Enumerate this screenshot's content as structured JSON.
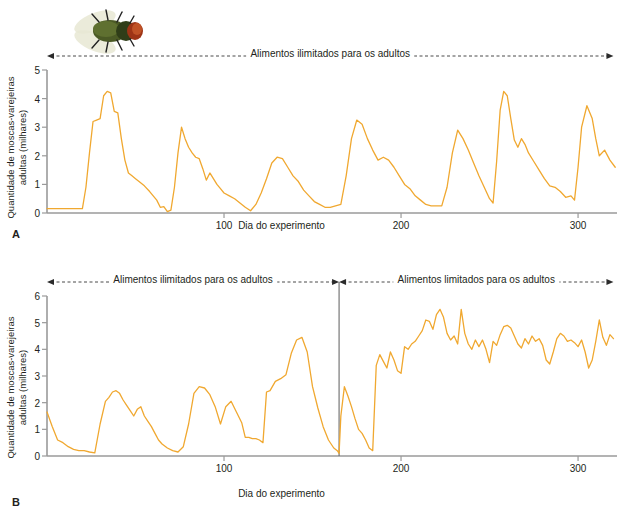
{
  "figure": {
    "organism_icon": "blowfly-photo",
    "line_color": "#F0A830",
    "axis_color": "#9a9a9a",
    "text_color": "#231f20"
  },
  "panels": [
    {
      "letter": "A",
      "ylabel_line1": "Quantidade de moscas-varejeiras",
      "ylabel_line2": "adultas (milhares)",
      "xlabel": "Dia do experimento",
      "yticks": [
        "0",
        "1",
        "2",
        "3",
        "4",
        "5"
      ],
      "xticks": [
        "100",
        "200",
        "300"
      ],
      "annotations": [
        {
          "text": "Alimentos ilimitados para os adultos",
          "from_day": 0,
          "to_day": 320
        }
      ]
    },
    {
      "letter": "B",
      "ylabel_line1": "Quantidade de moscas-varejeiras",
      "ylabel_line2": "adultas (milhares)",
      "xlabel": "Dia do experimento",
      "yticks": [
        "0",
        "1",
        "2",
        "3",
        "4",
        "5",
        "6"
      ],
      "xticks": [
        "100",
        "200",
        "300"
      ],
      "annotations": [
        {
          "text": "Alimentos ilimitados para os adultos",
          "from_day": 0,
          "to_day": 165
        },
        {
          "text": "Alimentos limitados para os adultos",
          "from_day": 165,
          "to_day": 320
        }
      ],
      "divider_day": 165
    }
  ],
  "chart_data": [
    {
      "type": "line",
      "title": "A",
      "xlabel": "Dia do experimento",
      "ylabel": "Quantidade de moscas-varejeiras adultas (milhares)",
      "xlim": [
        0,
        322
      ],
      "ylim": [
        0,
        5
      ],
      "xticks": [
        100,
        200,
        300
      ],
      "yticks": [
        0,
        1,
        2,
        3,
        4,
        5
      ],
      "grid": false,
      "legend": "none",
      "series": [
        {
          "name": "Quantidade de moscas adultas",
          "color": "#F0A830",
          "x": [
            0,
            6,
            12,
            16,
            20,
            22,
            24,
            26,
            28,
            30,
            32,
            34,
            36,
            38,
            40,
            42,
            44,
            46,
            48,
            50,
            52,
            55,
            58,
            60,
            62,
            64,
            66,
            68,
            70,
            72,
            74,
            76,
            78,
            80,
            82,
            84,
            86,
            88,
            90,
            92,
            94,
            96,
            98,
            100,
            103,
            106,
            109,
            112,
            115,
            118,
            121,
            124,
            127,
            130,
            133,
            136,
            139,
            142,
            145,
            148,
            151,
            154,
            157,
            160,
            163,
            166,
            169,
            172,
            175,
            178,
            181,
            184,
            187,
            190,
            193,
            196,
            199,
            202,
            205,
            208,
            211,
            214,
            217,
            220,
            223,
            226,
            229,
            232,
            235,
            238,
            241,
            244,
            247,
            250,
            252,
            254,
            256,
            258,
            260,
            262,
            264,
            266,
            268,
            270,
            272,
            275,
            278,
            281,
            284,
            287,
            290,
            293,
            296,
            298,
            300,
            302,
            305,
            308,
            310,
            312,
            315,
            318,
            321
          ],
          "y": [
            0.15,
            0.15,
            0.15,
            0.15,
            0.15,
            0.9,
            2.1,
            3.2,
            3.25,
            3.3,
            4.1,
            4.25,
            4.2,
            3.55,
            3.5,
            2.6,
            1.85,
            1.4,
            1.3,
            1.2,
            1.1,
            0.95,
            0.75,
            0.6,
            0.45,
            0.2,
            0.22,
            0.05,
            0.1,
            0.9,
            2.1,
            3.0,
            2.6,
            2.3,
            2.1,
            1.95,
            1.9,
            1.55,
            1.15,
            1.4,
            1.2,
            1.0,
            0.85,
            0.7,
            0.6,
            0.5,
            0.35,
            0.2,
            0.08,
            0.3,
            0.7,
            1.2,
            1.75,
            1.95,
            1.9,
            1.6,
            1.3,
            1.1,
            0.8,
            0.6,
            0.4,
            0.3,
            0.2,
            0.2,
            0.25,
            0.3,
            1.3,
            2.6,
            3.25,
            3.1,
            2.6,
            2.2,
            1.85,
            1.95,
            1.85,
            1.6,
            1.3,
            1.0,
            0.85,
            0.6,
            0.45,
            0.3,
            0.25,
            0.25,
            0.25,
            0.9,
            2.1,
            2.9,
            2.6,
            2.2,
            1.75,
            1.3,
            0.9,
            0.5,
            0.35,
            1.8,
            3.6,
            4.25,
            4.1,
            3.3,
            2.55,
            2.3,
            2.6,
            2.4,
            2.1,
            1.8,
            1.5,
            1.2,
            0.95,
            0.9,
            0.75,
            0.55,
            0.6,
            0.45,
            1.6,
            3.0,
            3.75,
            3.3,
            2.6,
            2.0,
            2.2,
            1.85,
            1.6
          ]
        }
      ]
    },
    {
      "type": "line",
      "title": "B",
      "xlabel": "Dia do experimento",
      "ylabel": "Quantidade de moscas-varejeiras adultas (milhares)",
      "xlim": [
        0,
        322
      ],
      "ylim": [
        0,
        6
      ],
      "xticks": [
        100,
        200,
        300
      ],
      "yticks": [
        0,
        1,
        2,
        3,
        4,
        5,
        6
      ],
      "grid": false,
      "legend": "none",
      "divider_x": 165,
      "series": [
        {
          "name": "Quantidade de moscas adultas",
          "color": "#F0A830",
          "x": [
            0,
            3,
            6,
            9,
            12,
            15,
            18,
            21,
            24,
            27,
            30,
            33,
            35,
            37,
            39,
            41,
            43,
            45,
            47,
            49,
            51,
            53,
            55,
            57,
            59,
            61,
            63,
            65,
            68,
            71,
            74,
            77,
            80,
            83,
            86,
            89,
            92,
            95,
            98,
            101,
            104,
            107,
            110,
            112,
            114,
            116,
            118,
            120,
            122,
            124,
            126,
            129,
            132,
            135,
            138,
            141,
            144,
            147,
            150,
            153,
            156,
            159,
            162,
            164,
            165,
            166,
            168,
            170,
            172,
            174,
            176,
            178,
            180,
            182,
            184,
            186,
            188,
            190,
            192,
            194,
            196,
            198,
            200,
            202,
            204,
            206,
            208,
            210,
            212,
            214,
            216,
            218,
            220,
            222,
            224,
            226,
            228,
            230,
            232,
            234,
            236,
            238,
            240,
            242,
            244,
            246,
            248,
            250,
            252,
            254,
            256,
            258,
            260,
            262,
            264,
            266,
            268,
            270,
            272,
            274,
            276,
            278,
            280,
            282,
            284,
            286,
            288,
            290,
            292,
            294,
            296,
            298,
            300,
            302,
            304,
            306,
            308,
            310,
            312,
            314,
            316,
            318,
            320
          ],
          "y": [
            1.65,
            1.1,
            0.6,
            0.5,
            0.35,
            0.25,
            0.2,
            0.2,
            0.15,
            0.12,
            1.2,
            2.05,
            2.2,
            2.4,
            2.45,
            2.35,
            2.1,
            1.9,
            1.7,
            1.5,
            1.75,
            1.85,
            1.5,
            1.3,
            1.1,
            0.85,
            0.6,
            0.45,
            0.3,
            0.2,
            0.15,
            0.35,
            1.2,
            2.35,
            2.6,
            2.55,
            2.3,
            1.85,
            1.2,
            1.85,
            2.05,
            1.65,
            1.25,
            0.7,
            0.7,
            0.65,
            0.65,
            0.6,
            0.5,
            2.4,
            2.45,
            2.8,
            2.9,
            3.05,
            3.85,
            4.35,
            4.45,
            3.9,
            2.6,
            1.8,
            1.1,
            0.6,
            0.3,
            0.2,
            0.1,
            1.5,
            2.6,
            2.25,
            1.85,
            1.4,
            1.0,
            0.85,
            0.6,
            0.3,
            0.2,
            3.4,
            3.8,
            3.55,
            3.3,
            3.9,
            3.6,
            3.2,
            3.1,
            4.1,
            4.0,
            4.2,
            4.3,
            4.5,
            4.7,
            5.1,
            5.05,
            4.75,
            5.3,
            5.5,
            5.2,
            4.6,
            4.35,
            4.5,
            4.2,
            5.5,
            4.6,
            4.2,
            4.0,
            4.35,
            4.1,
            4.35,
            4.0,
            3.5,
            4.3,
            4.15,
            4.55,
            4.85,
            4.9,
            4.8,
            4.5,
            4.2,
            4.05,
            4.4,
            4.2,
            4.5,
            4.3,
            4.4,
            4.15,
            3.6,
            3.45,
            3.9,
            4.4,
            4.6,
            4.5,
            4.3,
            4.35,
            4.25,
            4.1,
            4.35,
            3.9,
            3.3,
            3.6,
            4.3,
            5.1,
            4.45,
            4.15,
            4.55,
            4.4,
            4.25,
            4.5
          ]
        }
      ]
    }
  ]
}
